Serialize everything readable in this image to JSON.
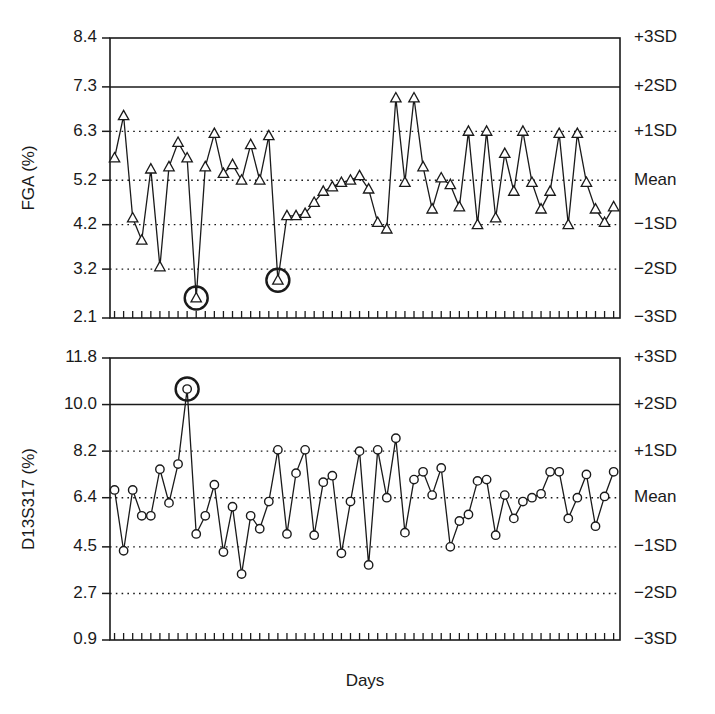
{
  "figure": {
    "xlabel": "Days",
    "background": "#ffffff",
    "ink_color": "#1a1a1a"
  },
  "chart_data": [
    {
      "type": "line",
      "panel": "top",
      "title": "",
      "ylabel": "FGA (%)",
      "xlabel": "",
      "grid": true,
      "legend": null,
      "ylim": [
        2.1,
        8.4
      ],
      "xlim": [
        0,
        56
      ],
      "ytick_labels": [
        "8.4",
        "7.3",
        "6.3",
        "5.2",
        "4.2",
        "3.2",
        "2.1"
      ],
      "ytick_values": [
        8.4,
        7.3,
        6.3,
        5.2,
        4.2,
        3.2,
        2.1
      ],
      "right_labels": [
        "+3SD",
        "+2SD",
        "+1SD",
        "Mean",
        "-1SD",
        "-2SD",
        "-3SD"
      ],
      "right_label_values": [
        8.4,
        7.3,
        6.3,
        5.2,
        4.2,
        3.2,
        2.1
      ],
      "reference_lines": [
        {
          "value": 8.4,
          "style": "solid",
          "label": "+3SD"
        },
        {
          "value": 7.3,
          "style": "solid",
          "label": "+2SD"
        },
        {
          "value": 6.3,
          "style": "dotted",
          "label": "+1SD"
        },
        {
          "value": 5.2,
          "style": "dotted",
          "label": "Mean"
        },
        {
          "value": 4.2,
          "style": "dotted",
          "label": "-1SD"
        },
        {
          "value": 3.2,
          "style": "dotted",
          "label": "-2SD"
        },
        {
          "value": 2.1,
          "style": "solid",
          "label": "-3SD"
        }
      ],
      "marker": "triangle",
      "n_points": 56,
      "x": [
        1,
        2,
        3,
        4,
        5,
        6,
        7,
        8,
        9,
        10,
        11,
        12,
        13,
        14,
        15,
        16,
        17,
        18,
        19,
        20,
        21,
        22,
        23,
        24,
        25,
        26,
        27,
        28,
        29,
        30,
        31,
        32,
        33,
        34,
        35,
        36,
        37,
        38,
        39,
        40,
        41,
        42,
        43,
        44,
        45,
        46,
        47,
        48,
        49,
        50,
        51,
        52,
        53,
        54,
        55,
        56
      ],
      "values": [
        5.7,
        6.65,
        4.35,
        3.85,
        5.45,
        3.25,
        5.5,
        6.05,
        5.7,
        2.55,
        5.5,
        6.25,
        5.35,
        5.55,
        5.2,
        6.0,
        5.2,
        6.2,
        2.95,
        4.4,
        4.4,
        4.45,
        4.7,
        4.95,
        5.05,
        5.15,
        5.2,
        5.3,
        5.0,
        4.25,
        4.1,
        7.05,
        5.15,
        7.05,
        5.5,
        4.55,
        5.25,
        5.1,
        4.6,
        6.3,
        4.2,
        6.3,
        4.35,
        5.8,
        4.95,
        6.3,
        5.15,
        4.55,
        4.95,
        6.25,
        4.2,
        6.25,
        5.15,
        4.55,
        4.25,
        4.6
      ],
      "highlighted_points": [
        {
          "index": 10,
          "x": 10,
          "y": 2.55,
          "note": "circled outlier below -2SD"
        },
        {
          "index": 19,
          "x": 19,
          "y": 2.95,
          "note": "circled outlier below -2SD"
        }
      ]
    },
    {
      "type": "line",
      "panel": "bottom",
      "title": "",
      "ylabel": "D13S317 (%)",
      "xlabel": "Days",
      "grid": true,
      "legend": null,
      "ylim": [
        0.9,
        11.8
      ],
      "xlim": [
        0,
        56
      ],
      "ytick_labels": [
        "11.8",
        "10.0",
        "8.2",
        "6.4",
        "4.5",
        "2.7",
        "0.9"
      ],
      "ytick_values": [
        11.8,
        10.0,
        8.2,
        6.4,
        4.5,
        2.7,
        0.9
      ],
      "right_labels": [
        "+3SD",
        "+2SD",
        "+1SD",
        "Mean",
        "-1SD",
        "-2SD",
        "-3SD"
      ],
      "right_label_values": [
        11.8,
        10.0,
        8.2,
        6.4,
        4.5,
        2.7,
        0.9
      ],
      "reference_lines": [
        {
          "value": 11.8,
          "style": "solid",
          "label": "+3SD"
        },
        {
          "value": 10.0,
          "style": "solid",
          "label": "+2SD"
        },
        {
          "value": 8.2,
          "style": "dotted",
          "label": "+1SD"
        },
        {
          "value": 6.4,
          "style": "dotted",
          "label": "Mean"
        },
        {
          "value": 4.5,
          "style": "dotted",
          "label": "-1SD"
        },
        {
          "value": 2.7,
          "style": "dotted",
          "label": "-2SD"
        },
        {
          "value": 0.9,
          "style": "solid",
          "label": "-3SD"
        }
      ],
      "marker": "circle",
      "n_points": 56,
      "x": [
        1,
        2,
        3,
        4,
        5,
        6,
        7,
        8,
        9,
        10,
        11,
        12,
        13,
        14,
        15,
        16,
        17,
        18,
        19,
        20,
        21,
        22,
        23,
        24,
        25,
        26,
        27,
        28,
        29,
        30,
        31,
        32,
        33,
        34,
        35,
        36,
        37,
        38,
        39,
        40,
        41,
        42,
        43,
        44,
        45,
        46,
        47,
        48,
        49,
        50,
        51,
        52,
        53,
        54,
        55,
        56
      ],
      "values": [
        6.7,
        4.35,
        6.7,
        5.7,
        5.7,
        7.5,
        6.2,
        7.7,
        10.6,
        5.0,
        5.7,
        6.9,
        4.3,
        6.05,
        3.45,
        5.7,
        5.2,
        6.25,
        8.25,
        5.0,
        7.35,
        8.25,
        4.95,
        7.0,
        7.25,
        4.25,
        6.25,
        8.2,
        3.8,
        8.25,
        6.4,
        8.7,
        5.05,
        7.1,
        7.4,
        6.5,
        7.55,
        4.5,
        5.5,
        5.75,
        7.05,
        7.1,
        4.95,
        6.5,
        5.6,
        6.25,
        6.4,
        6.55,
        7.4,
        7.4,
        5.6,
        6.4,
        7.3,
        5.3,
        6.45,
        7.4
      ],
      "highlighted_points": [
        {
          "index": 9,
          "x": 9,
          "y": 10.6,
          "note": "circled outlier above +2SD"
        }
      ]
    }
  ]
}
